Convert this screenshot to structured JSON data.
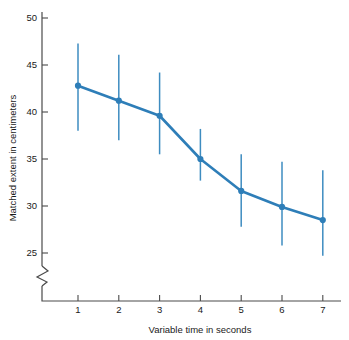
{
  "chart_data": {
    "type": "line",
    "title": "",
    "subtitle": "",
    "xlabel": "Variable time in seconds",
    "ylabel": "Matched extent in centimeters",
    "x": [
      1,
      2,
      3,
      4,
      5,
      6,
      7
    ],
    "values": [
      42.8,
      41.2,
      39.6,
      35.0,
      31.6,
      29.9,
      28.5
    ],
    "error_upper": [
      47.3,
      46.1,
      44.2,
      38.2,
      35.5,
      34.7,
      33.8
    ],
    "error_lower": [
      38.0,
      37.0,
      35.5,
      32.7,
      27.8,
      25.8,
      24.7
    ],
    "series": [
      {
        "name": "Matched extent",
        "values": [
          42.8,
          41.2,
          39.6,
          35.0,
          31.6,
          29.9,
          28.5
        ]
      }
    ],
    "xtick_labels": [
      "1",
      "2",
      "3",
      "4",
      "5",
      "6",
      "7"
    ],
    "ytick_labels": [
      "25",
      "30",
      "35",
      "40",
      "45",
      "50"
    ],
    "yticks": [
      25,
      30,
      35,
      40,
      45,
      50
    ],
    "xlim": [
      0.4,
      7.6
    ],
    "ylim": [
      24,
      50.8
    ],
    "grid": false,
    "legend": null,
    "axis_break": true,
    "axis_break_axis": "y",
    "line_color": "#2E7EB8",
    "marker_color": "#2E7EB8",
    "error_bar_color": "#3E8CC0",
    "axis_color": "#4a4a4a",
    "background_color": "#ffffff",
    "annotations": []
  },
  "figure": {
    "alt": "Line chart with error bars of matched extent in centimeters versus variable time in seconds"
  }
}
